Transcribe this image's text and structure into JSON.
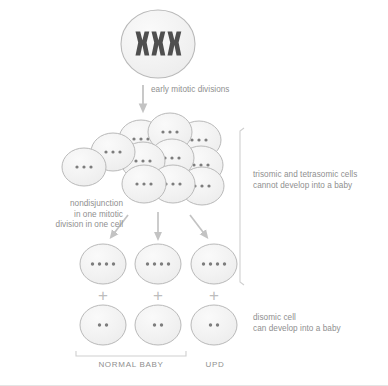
{
  "diagram": {
    "background_color": "#ffffff",
    "cell_fill": "#f2f2f2",
    "cell_stroke": "#b9b9b9",
    "dot_color": "#7d7d7d",
    "chromosome_color": "#4f4f4f",
    "arrow_color": "#c3c3c3",
    "text_color": "#8f8f8f",
    "bracket_color": "#cfcfcf"
  },
  "zygote": {
    "name": "trisomic zygote",
    "chromosome_count": 3,
    "chromosome_glyph": "X"
  },
  "arrows": {
    "mitosis_label": "early mitotic divisions",
    "left_label": "nondisjunction\nin one mitotic\ndivision in one cell"
  },
  "cluster": {
    "label": "cell cluster after early mitotic divisions",
    "dots_per_cell": 3,
    "cell_count": 12,
    "cells": [
      {
        "cx": 84,
        "cy": 167,
        "dots": 3
      },
      {
        "cx": 113,
        "cy": 152,
        "dots": 3
      },
      {
        "cx": 141,
        "cy": 139,
        "dots": 3
      },
      {
        "cx": 170,
        "cy": 132,
        "dots": 3
      },
      {
        "cx": 199,
        "cy": 140,
        "dots": 3
      },
      {
        "cx": 143,
        "cy": 161,
        "dots": 3
      },
      {
        "cx": 172,
        "cy": 158,
        "dots": 3
      },
      {
        "cx": 201,
        "cy": 165,
        "dots": 3
      },
      {
        "cx": 144,
        "cy": 184,
        "dots": 3
      },
      {
        "cx": 173,
        "cy": 184,
        "dots": 3
      },
      {
        "cx": 202,
        "cy": 186,
        "dots": 3
      }
    ]
  },
  "row_tetrasomic": {
    "label": "tetrasomic cells",
    "dots_per_cell": 4,
    "cells": [
      {
        "cx": 103,
        "cy": 264,
        "dots": 4
      },
      {
        "cx": 158,
        "cy": 264,
        "dots": 4
      },
      {
        "cx": 214,
        "cy": 264,
        "dots": 4
      }
    ]
  },
  "plus_signs": {
    "symbol": "+",
    "positions": [
      103,
      158,
      214
    ]
  },
  "row_disomic": {
    "label": "disomic cells",
    "dots_per_cell": 2,
    "cells": [
      {
        "cx": 103,
        "cy": 325,
        "dots": 2
      },
      {
        "cx": 158,
        "cy": 325,
        "dots": 2
      },
      {
        "cx": 214,
        "cy": 325,
        "dots": 2
      }
    ]
  },
  "annotations": {
    "right_top": "trisomic and tetrasomic cells\ncannot develop into a baby",
    "right_bottom": "disomic cell\ncan develop into a baby",
    "normal_baby": "NORMAL BABY",
    "upd": "UPD"
  }
}
